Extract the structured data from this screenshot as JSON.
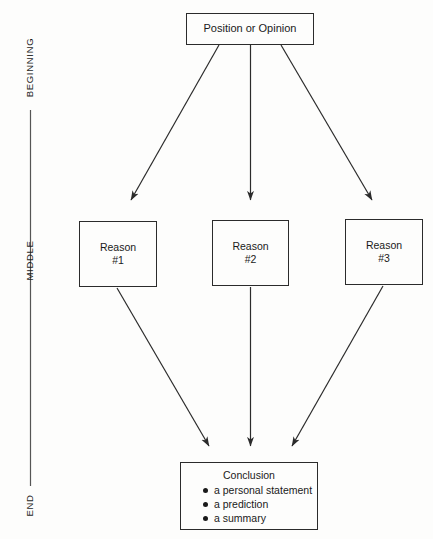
{
  "diagram": {
    "stages": [
      {
        "id": "beginning",
        "label": "BEGINNING"
      },
      {
        "id": "middle",
        "label": "MIDDLE"
      },
      {
        "id": "end",
        "label": "END"
      }
    ],
    "nodes": {
      "position": {
        "label": "Position or Opinion"
      },
      "reason1": {
        "line1": "Reason",
        "line2": "#1"
      },
      "reason2": {
        "line1": "Reason",
        "line2": "#2"
      },
      "reason3": {
        "line1": "Reason",
        "line2": "#3"
      },
      "conclusion": {
        "title": "Conclusion",
        "items": [
          "a personal statement",
          "a prediction",
          "a summary"
        ]
      }
    },
    "colors": {
      "ink": "#2b2b2b",
      "text": "#1a1a1a",
      "background": "#fdfdfc",
      "axis": "#555555"
    }
  }
}
